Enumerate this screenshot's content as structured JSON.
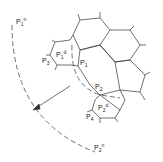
{
  "diagram": {
    "type": "hexagonal-mesh with dashed arcs",
    "labels": {
      "p1n": {
        "base": "P",
        "sub": "1",
        "sup": "n"
      },
      "p3": {
        "base": "P",
        "sub": "3"
      },
      "p1d": {
        "base": "P",
        "sub": "1",
        "sup": "d"
      },
      "p1": {
        "base": "P",
        "sub": "1"
      },
      "p2": {
        "base": "P",
        "sub": "2"
      },
      "p2d": {
        "base": "P",
        "sub": "2",
        "sup": "d"
      },
      "p4": {
        "base": "P",
        "sub": "4"
      },
      "p2n": {
        "base": "P",
        "sub": "2",
        "sup": "n"
      }
    },
    "colors": {
      "stroke": "#333333",
      "background": "#ffffff"
    }
  }
}
